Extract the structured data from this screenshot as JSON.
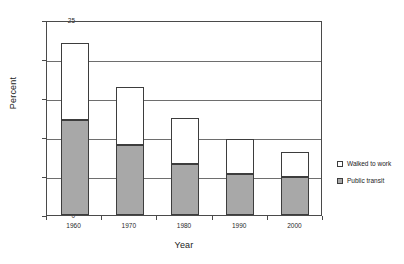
{
  "chart_data": {
    "type": "bar",
    "subtype": "stacked-vertical",
    "title": "",
    "xlabel": "Year",
    "ylabel": "Percent",
    "categories": [
      "1960",
      "1970",
      "1980",
      "1990",
      "2000"
    ],
    "ylim": [
      0,
      25
    ],
    "yticks": [
      "0",
      "5",
      "10",
      "15",
      "20",
      "25"
    ],
    "grid": "horizontal",
    "legend_position": "right",
    "series": [
      {
        "name": "Public transit",
        "color": "#a8a8a8",
        "values": [
          12.2,
          9.0,
          6.6,
          5.3,
          4.9
        ]
      },
      {
        "name": "Walked to work",
        "color": "#ffffff",
        "values": [
          9.9,
          7.4,
          5.9,
          4.5,
          3.2
        ]
      }
    ],
    "totals": [
      22.1,
      16.4,
      12.5,
      9.8,
      8.1
    ]
  },
  "legend": {
    "entries": [
      {
        "label": "Walked to work",
        "swatch": "#ffffff"
      },
      {
        "label": "Public transit",
        "swatch": "#a8a8a8"
      }
    ]
  },
  "colors": {
    "transit_fill": "#a8a8a8",
    "walked_fill": "#ffffff",
    "outline": "#3d3d3d",
    "gridline": "#6e6e6e",
    "axis": "#4a4a4a",
    "background": "#ffffff"
  }
}
